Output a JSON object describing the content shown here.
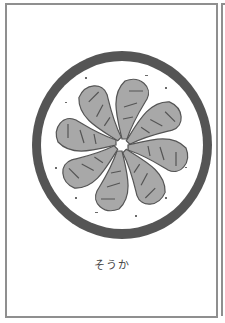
{
  "card": {
    "caption": "そうか",
    "illustration": {
      "subject": "shrimp-platter-icon",
      "plate_ring_color": "#555555",
      "shrimp_fill": "#a8a8a8",
      "shrimp_outline": "#555555",
      "shrimp_count": 8
    },
    "border_color": "#8f8f8f"
  }
}
